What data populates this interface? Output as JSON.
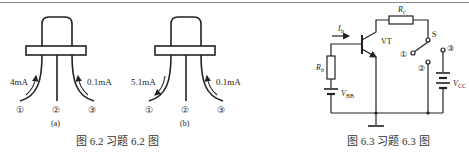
{
  "figures": [
    {
      "id": "fig-6-2",
      "caption": "图 6.2   习题 6.2 图",
      "subfigures": [
        {
          "label": "(a)",
          "pins": [
            "①",
            "②",
            "③"
          ],
          "currents": [
            {
              "pin": "①",
              "value": "4mA",
              "direction": "into"
            },
            {
              "pin": "③",
              "value": "0.1mA",
              "direction": "into"
            }
          ]
        },
        {
          "label": "(b)",
          "pins": [
            "①",
            "②",
            "③"
          ],
          "currents": [
            {
              "pin": "①",
              "value": "5.1mA",
              "direction": "out"
            },
            {
              "pin": "③",
              "value": "0.1mA",
              "direction": "into"
            }
          ]
        }
      ]
    },
    {
      "id": "fig-6-3",
      "caption": "图 6.3   习题 6.3 图",
      "components": {
        "transistor": "VT",
        "base_current": "I",
        "base_current_sub": "b",
        "base_resistor": "R",
        "base_resistor_sub": "b",
        "collector_resistor": "R",
        "collector_resistor_sub": "c",
        "base_source": "V",
        "base_source_sub": "BB",
        "collector_source": "V",
        "collector_source_sub": "CC",
        "switch": "S",
        "switch_positions": [
          "①",
          "②",
          "③"
        ]
      }
    }
  ]
}
